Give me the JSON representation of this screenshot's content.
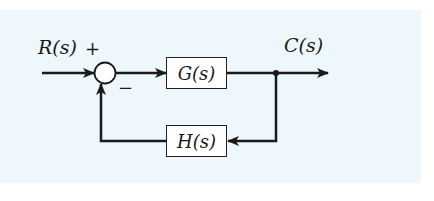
{
  "diagram": {
    "type": "feedback-control-block-diagram",
    "input": {
      "label": "R(s)"
    },
    "output": {
      "label": "C(s)"
    },
    "summing_junction": {
      "plus_sign": "+",
      "minus_sign": "−"
    },
    "forward_block": {
      "label": "G(s)"
    },
    "feedback_block": {
      "label": "H(s)"
    },
    "colors": {
      "background": "#eef7fb",
      "stroke": "#222222",
      "block_fill": "#ffffff"
    }
  }
}
